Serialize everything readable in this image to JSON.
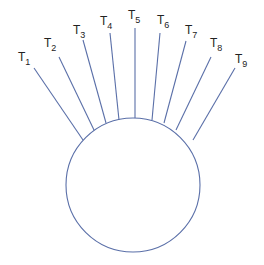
{
  "diagram": {
    "type": "star-circle",
    "stroke_color": "#5a6fa8",
    "label_color": "#222222",
    "circle": {
      "cx": 133,
      "cy": 185,
      "r": 67
    },
    "terminals": [
      {
        "label": "T",
        "sub": "1",
        "tx": 18,
        "ty": 61,
        "x1": 34,
        "y1": 68,
        "x2": 83,
        "y2": 140
      },
      {
        "label": "T",
        "sub": "2",
        "tx": 44,
        "ty": 47,
        "x1": 59,
        "y1": 57,
        "x2": 94,
        "y2": 130
      },
      {
        "label": "T",
        "sub": "3",
        "tx": 73,
        "ty": 34,
        "x1": 83,
        "y1": 40,
        "x2": 106,
        "y2": 123
      },
      {
        "label": "T",
        "sub": "4",
        "tx": 100,
        "ty": 25,
        "x1": 110,
        "y1": 33,
        "x2": 119,
        "y2": 120
      },
      {
        "label": "T",
        "sub": "5",
        "tx": 128,
        "ty": 19,
        "x1": 135,
        "y1": 28,
        "x2": 135,
        "y2": 118
      },
      {
        "label": "T",
        "sub": "6",
        "tx": 157,
        "ty": 24,
        "x1": 160,
        "y1": 33,
        "x2": 152,
        "y2": 120
      },
      {
        "label": "T",
        "sub": "7",
        "tx": 185,
        "ty": 34,
        "x1": 186,
        "y1": 41,
        "x2": 164,
        "y2": 123
      },
      {
        "label": "T",
        "sub": "8",
        "tx": 210,
        "ty": 47,
        "x1": 211,
        "y1": 57,
        "x2": 176,
        "y2": 130
      },
      {
        "label": "T",
        "sub": "9",
        "tx": 235,
        "ty": 63,
        "x1": 235,
        "y1": 68,
        "x2": 193,
        "y2": 140
      }
    ]
  }
}
